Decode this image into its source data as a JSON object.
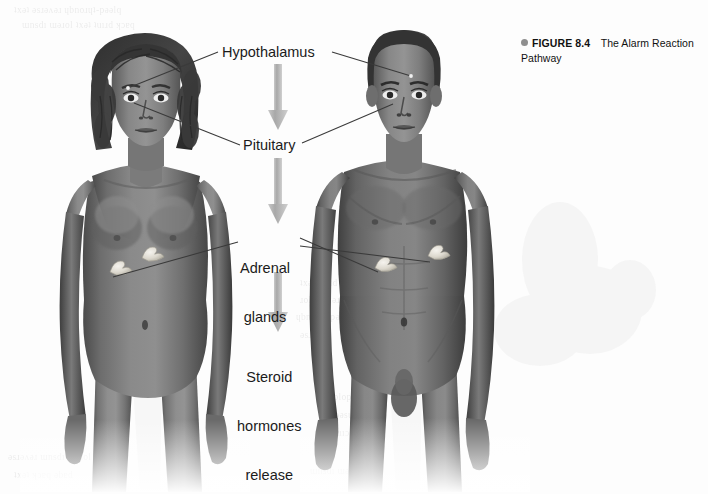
{
  "figure": {
    "caption": {
      "bullet_icon": "filled-circle-bullet",
      "figure_number": "FIGURE 8.4",
      "title": "The Alarm Reaction Pathway",
      "bullet_color": "#8f8f8f",
      "text_color": "#111111"
    },
    "diagram_type": "anatomical-flow-diagram",
    "flow_steps": [
      {
        "id": "hypothalamus",
        "label": "Hypothalamus"
      },
      {
        "id": "pituitary",
        "label": "Pituitary"
      },
      {
        "id": "adrenal",
        "label": "Adrenal\nglands",
        "line1": "Adrenal",
        "line2": "glands"
      },
      {
        "id": "steroid",
        "label": "Steroid\nhormones\nrelease",
        "line1": "Steroid",
        "line2": "hormones",
        "line3": "release"
      }
    ],
    "arrows": {
      "count": 3,
      "direction": "down",
      "color": "#b0b0b0"
    },
    "figures": [
      {
        "id": "female-figure",
        "description": "Female anatomical figure, front view, braided shoulder-length hair",
        "position": "left"
      },
      {
        "id": "male-figure",
        "description": "Male anatomical figure, front view, short hair",
        "position": "right"
      }
    ],
    "organ_markers": {
      "adrenal_gland_color": "#e8e6df",
      "per_figure": 2
    },
    "leader_line_color": "#3a3a3a",
    "background_color": "#fdfdfd"
  }
}
